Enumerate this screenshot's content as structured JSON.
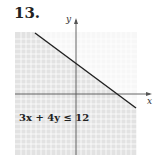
{
  "problem": {
    "number": "13."
  },
  "graph": {
    "x_label": "x",
    "y_label": "y",
    "inequality": "3x + 4y ≤ 12",
    "boundary_line": {
      "equation": "3x + 4y = 12",
      "x_intercept": 4,
      "y_intercept": 3,
      "style": "solid"
    },
    "shaded_region": "below line",
    "colors": {
      "shade": "#e4e4e4",
      "grid": "#ffffff",
      "line": "#222222",
      "axis": "#555555"
    }
  }
}
